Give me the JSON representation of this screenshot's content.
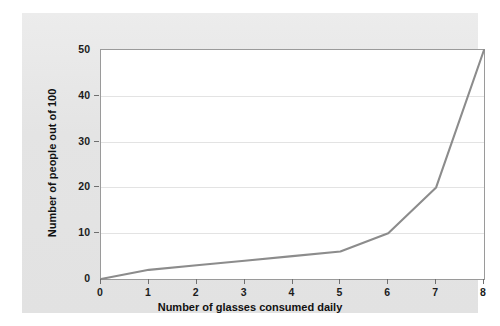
{
  "chart_data": {
    "type": "line",
    "title": "",
    "xlabel": "Number of glasses consumed daily",
    "ylabel": "Number of people out of 100",
    "x": [
      0,
      1,
      2,
      3,
      4,
      5,
      6,
      7,
      8
    ],
    "values": [
      0,
      2,
      3,
      4,
      5,
      6,
      10,
      20,
      50
    ],
    "series": [
      {
        "name": "",
        "values": [
          0,
          2,
          3,
          4,
          5,
          6,
          10,
          20,
          50
        ]
      }
    ],
    "xlim": [
      0,
      8
    ],
    "ylim": [
      0,
      50
    ],
    "xticks": [
      "0",
      "1",
      "2",
      "3",
      "4",
      "5",
      "6",
      "7",
      "8"
    ],
    "yticks": [
      "0",
      "10",
      "20",
      "30",
      "40",
      "50"
    ],
    "xtick_values": [
      0,
      1,
      2,
      3,
      4,
      5,
      6,
      7,
      8
    ],
    "ytick_values": [
      0,
      10,
      20,
      30,
      40,
      50
    ],
    "grid": "horizontal",
    "legend": "none",
    "line_color": "#8c8c8c",
    "grid_color": "#e3e3e3",
    "plot_background": "#ffffff",
    "figure_background": "#e8e8e8",
    "axis_color": "#9a9a9a"
  }
}
